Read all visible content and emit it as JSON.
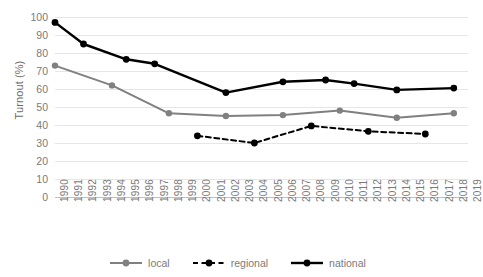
{
  "chart_data": {
    "type": "line",
    "title": "",
    "xlabel": "",
    "ylabel": "Turnout (%)",
    "ylim": [
      0,
      100
    ],
    "ytick_step": 10,
    "yticks": [
      0,
      10,
      20,
      30,
      40,
      50,
      60,
      70,
      80,
      90,
      100
    ],
    "grid": "horizontal",
    "legend_position": "bottom",
    "x": [
      1990,
      1991,
      1992,
      1993,
      1994,
      1995,
      1996,
      1997,
      1998,
      1999,
      2000,
      2001,
      2002,
      2003,
      2004,
      2005,
      2006,
      2007,
      2008,
      2009,
      2010,
      2011,
      2012,
      2013,
      2014,
      2015,
      2016,
      2017,
      2018,
      2019
    ],
    "series": [
      {
        "name": "local",
        "color": "#808080",
        "style": "solid",
        "points": [
          {
            "x": 1990,
            "y": 73
          },
          {
            "x": 1994,
            "y": 62
          },
          {
            "x": 1998,
            "y": 46.5
          },
          {
            "x": 2002,
            "y": 45
          },
          {
            "x": 2006,
            "y": 45.5
          },
          {
            "x": 2010,
            "y": 48
          },
          {
            "x": 2014,
            "y": 44
          },
          {
            "x": 2018,
            "y": 46.5
          }
        ]
      },
      {
        "name": "regional",
        "color": "#000000",
        "style": "dashed",
        "points": [
          {
            "x": 2000,
            "y": 34
          },
          {
            "x": 2004,
            "y": 30
          },
          {
            "x": 2008,
            "y": 39.5
          },
          {
            "x": 2012,
            "y": 36.5
          },
          {
            "x": 2016,
            "y": 35
          }
        ]
      },
      {
        "name": "national",
        "color": "#000000",
        "style": "solid",
        "points": [
          {
            "x": 1990,
            "y": 97
          },
          {
            "x": 1992,
            "y": 85
          },
          {
            "x": 1995,
            "y": 76.5
          },
          {
            "x": 1997,
            "y": 74
          },
          {
            "x": 2002,
            "y": 58
          },
          {
            "x": 2006,
            "y": 64
          },
          {
            "x": 2009,
            "y": 65
          },
          {
            "x": 2011,
            "y": 63
          },
          {
            "x": 2014,
            "y": 59.5
          },
          {
            "x": 2018,
            "y": 60.5
          }
        ]
      }
    ]
  },
  "legend": {
    "items": [
      {
        "label": "local"
      },
      {
        "label": "regional"
      },
      {
        "label": "national"
      }
    ]
  }
}
